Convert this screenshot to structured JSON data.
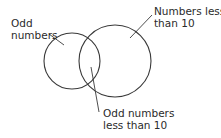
{
  "diagram": {
    "type": "venn",
    "stroke_color": "#3a3a3a",
    "sets": [
      {
        "id": "odd",
        "label_lines": [
          "Odd",
          "numbers"
        ]
      },
      {
        "id": "lt10",
        "label_lines": [
          "Numbers less",
          "than 10"
        ]
      }
    ],
    "intersection": {
      "label_lines": [
        "Odd numbers",
        "less than 10"
      ]
    }
  }
}
